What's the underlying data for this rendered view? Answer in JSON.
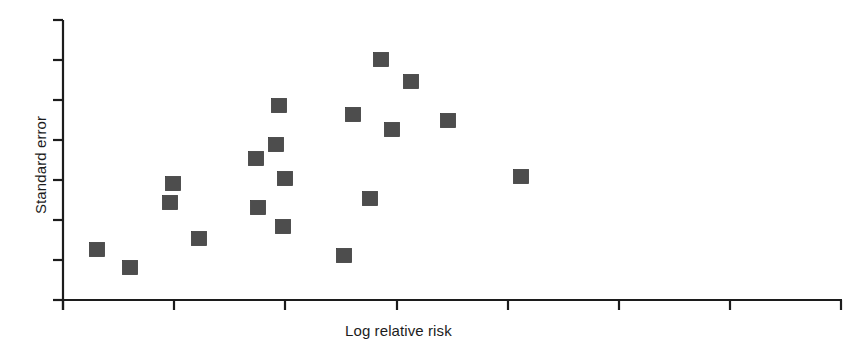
{
  "figure": {
    "name": "funnel-plot",
    "background_color": "#ffffff",
    "axis_color": "#1c1c1c",
    "marker_color": "#4d4d4d",
    "marker_edge_color": "#3c3c3c"
  },
  "chart_data": {
    "type": "scatter",
    "title": "",
    "xlabel": "Log relative risk",
    "ylabel": "Standard error",
    "grid": false,
    "legend": null,
    "xlim": [
      0,
      7
    ],
    "ylim": [
      0,
      7
    ],
    "x_ticks": [
      0,
      1,
      2,
      3,
      4,
      5,
      6,
      7
    ],
    "x_tick_labels": [
      "",
      "",
      "",
      "",
      "",
      "",
      "",
      ""
    ],
    "y_ticks": [
      0,
      1,
      2,
      3,
      4,
      5,
      6,
      7
    ],
    "y_tick_labels": [
      "",
      "",
      "",
      "",
      "",
      "",
      "",
      ""
    ],
    "marker": "square",
    "n_points": 19,
    "x": [
      0.3,
      0.6,
      0.96,
      1.0,
      1.22,
      1.73,
      1.75,
      1.91,
      1.94,
      1.98,
      2.0,
      2.53,
      2.61,
      2.76,
      2.86,
      2.96,
      3.13,
      3.46,
      4.12
    ],
    "y": [
      1.25,
      0.8,
      2.43,
      2.9,
      1.53,
      3.53,
      2.3,
      3.88,
      4.85,
      1.83,
      3.03,
      1.1,
      4.63,
      2.53,
      6.0,
      4.25,
      5.45,
      4.23,
      3.08
    ],
    "points_px": [
      {
        "cx": 97,
        "cy": 250
      },
      {
        "cx": 130,
        "cy": 268
      },
      {
        "cx": 170,
        "cy": 203
      },
      {
        "cx": 173,
        "cy": 184
      },
      {
        "cx": 199,
        "cy": 239
      },
      {
        "cx": 256,
        "cy": 159
      },
      {
        "cx": 258,
        "cy": 208
      },
      {
        "cx": 276,
        "cy": 145
      },
      {
        "cx": 279,
        "cy": 106
      },
      {
        "cx": 283,
        "cy": 227
      },
      {
        "cx": 285,
        "cy": 179
      },
      {
        "cx": 344,
        "cy": 256
      },
      {
        "cx": 353,
        "cy": 115
      },
      {
        "cx": 370,
        "cy": 199
      },
      {
        "cx": 381,
        "cy": 60
      },
      {
        "cx": 392,
        "cy": 130
      },
      {
        "cx": 411,
        "cy": 82
      },
      {
        "cx": 448,
        "cy": 121
      },
      {
        "cx": 521,
        "cy": 177
      }
    ],
    "marker_size_px": 15
  },
  "axes": {
    "x_axis": {
      "label": "Log relative risk",
      "line_px": {
        "x1": 63,
        "y1": 300,
        "x2": 842,
        "y2": 300
      },
      "tick_positions_px": [
        63,
        174,
        285,
        397,
        508,
        619,
        730,
        841
      ],
      "tick_length_px": 10
    },
    "y_axis": {
      "label": "Standard error",
      "line_px": {
        "x1": 63,
        "y1": 20,
        "x2": 63,
        "y2": 310
      },
      "tick_positions_px": [
        20,
        60,
        100,
        140,
        180,
        220,
        260,
        300
      ],
      "tick_length_px": 10
    }
  }
}
